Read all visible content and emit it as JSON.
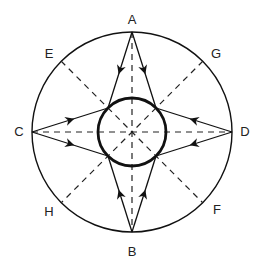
{
  "diagram": {
    "center": [
      132,
      132
    ],
    "outer_radius": 100,
    "inner_radius": 34,
    "colors": {
      "stroke": "#111111",
      "background": "#ffffff"
    },
    "points": {
      "A": {
        "label": "A",
        "x": 132,
        "y": 32,
        "lx": 132,
        "ly": 24
      },
      "B": {
        "label": "B",
        "x": 132,
        "y": 232,
        "lx": 132,
        "ly": 256
      },
      "C": {
        "label": "C",
        "x": 32,
        "y": 132,
        "lx": 19,
        "ly": 136
      },
      "D": {
        "label": "D",
        "x": 232,
        "y": 132,
        "lx": 245,
        "ly": 136
      },
      "E": {
        "label": "E",
        "x": 61,
        "y": 61,
        "lx": 49,
        "ly": 58
      },
      "G": {
        "label": "G",
        "x": 203,
        "y": 61,
        "lx": 216,
        "ly": 58
      },
      "H": {
        "label": "H",
        "x": 61,
        "y": 203,
        "lx": 49,
        "ly": 216
      },
      "F": {
        "label": "F",
        "x": 203,
        "y": 203,
        "lx": 217,
        "ly": 214
      }
    }
  }
}
